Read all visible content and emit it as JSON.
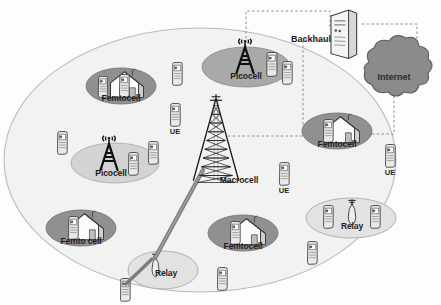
{
  "diagram": {
    "type": "network-topology",
    "colors": {
      "macro_coverage_fill": "#f2f2f2",
      "macro_coverage_stroke": "#b8b8b8",
      "femtocell_ellipse": "#8f8f8f",
      "picocell_ellipse_dark": "#a8a8a8",
      "picocell_ellipse_light": "#d2d2d2",
      "relay_ellipse": "#e0e0e0",
      "internet_cloud": "#8a8a8a",
      "link_dashed": "#8c8c8c",
      "link_solid_relay": "#7a7a7a",
      "device_body": "#e8e8e8",
      "device_outline": "#4a4a4a",
      "tower_dark": "#111111"
    },
    "nodes": [
      {
        "id": "macro-coverage",
        "kind": "coverage-ellipse",
        "label": "",
        "cx": 200,
        "cy": 160,
        "rx": 196,
        "ry": 132
      },
      {
        "id": "picocell-top",
        "kind": "picocell",
        "label": "Picocell",
        "cx": 246,
        "cy": 67,
        "rx": 44,
        "ry": 20,
        "shade": "dark",
        "label_x": 246,
        "label_y": 77
      },
      {
        "id": "picocell-left",
        "kind": "picocell",
        "label": "Picocell",
        "cx": 115,
        "cy": 163,
        "rx": 44,
        "ry": 20,
        "shade": "light",
        "label_x": 111,
        "label_y": 175
      },
      {
        "id": "femtocell-topleft",
        "kind": "femtocell",
        "label": "Femtocell",
        "cx": 121,
        "cy": 86,
        "rx": 35,
        "ry": 18,
        "label_x": 121,
        "label_y": 99
      },
      {
        "id": "femtocell-bottomleft",
        "kind": "femtocell",
        "label": "Femto cell",
        "cx": 81,
        "cy": 228,
        "rx": 35,
        "ry": 18,
        "label_x": 81,
        "label_y": 242
      },
      {
        "id": "femtocell-bottomcenter",
        "kind": "femtocell",
        "label": "Femtocell",
        "cx": 243,
        "cy": 233,
        "rx": 35,
        "ry": 18,
        "label_x": 243,
        "label_y": 247
      },
      {
        "id": "femtocell-right",
        "kind": "femtocell",
        "label": "Femtocell",
        "cx": 337,
        "cy": 131,
        "rx": 35,
        "ry": 18,
        "label_x": 337,
        "label_y": 146
      },
      {
        "id": "relay-bottom",
        "kind": "relay",
        "label": "Relay",
        "cx": 163,
        "cy": 270,
        "rx": 35,
        "ry": 18,
        "label_x": 166,
        "label_y": 275
      },
      {
        "id": "relay-right",
        "kind": "relay",
        "label": "Relay",
        "cx": 351,
        "cy": 218,
        "rx": 45,
        "ry": 20,
        "label_x": 352,
        "label_y": 227
      },
      {
        "id": "macrocell",
        "kind": "macrocell-tower",
        "label": "Macrocell",
        "cx": 216,
        "cy": 150,
        "label_x": 239,
        "label_y": 176
      },
      {
        "id": "backhaul",
        "kind": "server",
        "label": "Backhaul",
        "cx": 343,
        "cy": 30,
        "label_x": 311,
        "label_y": 38
      },
      {
        "id": "internet",
        "kind": "cloud",
        "label": "Internet",
        "cx": 394,
        "cy": 77,
        "label_x": 394,
        "label_y": 77
      }
    ],
    "ue_labelled": [
      {
        "id": "ue-center",
        "label": "UE",
        "x": 175,
        "y": 117,
        "label_x": 175,
        "label_y": 133
      },
      {
        "id": "ue-midright",
        "label": "UE",
        "x": 284,
        "y": 175,
        "label_x": 284,
        "label_y": 192
      },
      {
        "id": "ue-right",
        "label": "UE",
        "x": 390,
        "y": 157,
        "label_x": 390,
        "label_y": 174
      }
    ],
    "ue_unlabelled": [
      {
        "id": "ue-1",
        "x": 177,
        "y": 73
      },
      {
        "id": "ue-2",
        "x": 61,
        "y": 143
      },
      {
        "id": "ue-3",
        "x": 153,
        "y": 155
      },
      {
        "id": "ue-4",
        "x": 132,
        "y": 177
      },
      {
        "id": "ue-5",
        "x": 286,
        "y": 73
      },
      {
        "id": "ue-6",
        "x": 221,
        "y": 279
      },
      {
        "id": "ue-7",
        "x": 311,
        "y": 253
      },
      {
        "id": "ue-8",
        "x": 124,
        "y": 290
      },
      {
        "id": "ue-9",
        "x": 102,
        "y": 87
      },
      {
        "id": "ue-10",
        "x": 106,
        "y": 228
      },
      {
        "id": "ue-11",
        "x": 232,
        "y": 233
      },
      {
        "id": "ue-12",
        "x": 318,
        "y": 131
      },
      {
        "id": "ue-13",
        "x": 328,
        "y": 218
      },
      {
        "id": "ue-14",
        "x": 374,
        "y": 218
      },
      {
        "id": "ue-15",
        "x": 138,
        "y": 86
      }
    ],
    "links": [
      {
        "id": "link-pico-backhaul",
        "style": "dashed",
        "from": "picocell-top",
        "to": "backhaul"
      },
      {
        "id": "link-backhaul-internet",
        "style": "dashed",
        "from": "backhaul",
        "to": "internet"
      },
      {
        "id": "link-internet-femto",
        "style": "dashed",
        "from": "internet",
        "to": "femtocell-right"
      },
      {
        "id": "link-macro-backhaul",
        "style": "dashed",
        "from": "macrocell",
        "to": "backhaul"
      },
      {
        "id": "link-macro-relay",
        "style": "solid",
        "from": "macrocell",
        "to": "relay-bottom"
      },
      {
        "id": "link-relay-ue",
        "style": "solid",
        "from": "relay-bottom",
        "to": "ue-8"
      }
    ]
  }
}
